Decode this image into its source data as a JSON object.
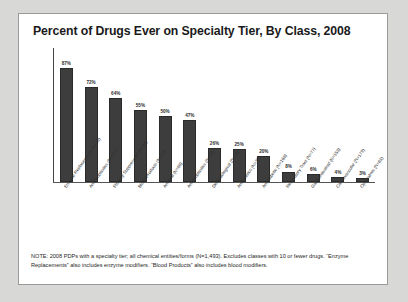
{
  "slide": {
    "title": "Percent of Drugs Ever on Specialty Tier, By Class, 2008",
    "note": "NOTE: 2008 PDPs with a specialty tier; all chemical entities/forms (N=1,493).  Excludes classes with 10 or fewer drugs.  “Enzyme Replacements” also includes enzyme modifiers.  “Blood Products” also includes blood modifiers."
  },
  "colors": {
    "bar": "#3d3d3d",
    "axis": "#444444",
    "slide_background": "#ffffff",
    "page_background": "#d8d8d6",
    "border": "#9a9a9a",
    "text": "#1a1a1a"
  },
  "chart_data": {
    "type": "bar",
    "title": "Percent of Drugs Ever on Specialty Tier, By Class, 2008",
    "xlabel": "",
    "ylabel": "",
    "ylim": [
      0,
      100
    ],
    "grid": false,
    "legend": "none",
    "categories": [
      "Enzyme Replacements (N=13)",
      "Antineoplastics (N=187)",
      "Pituitary Suppressant (N=34)",
      "Blood Products (N=22)",
      "Antiviral (N=88)",
      "Antineoplastics (N=79)",
      "Dermatological (N=24)",
      "Antiemetics (N=32)",
      "Antidiabetic (N=168)",
      "Respiratory Tract (N=77)",
      "Gastrointestinal (N=153)",
      "Cardiovascular (N=179)",
      "Ophthalmic (N=61)"
    ],
    "values": [
      87,
      72,
      64,
      55,
      50,
      47,
      26,
      25,
      20,
      8,
      6,
      4,
      3
    ],
    "value_labels": [
      "87%",
      "72%",
      "64%",
      "55%",
      "50%",
      "47%",
      "26%",
      "25%",
      "20%",
      "8%",
      "6%",
      "4%",
      "3%"
    ]
  }
}
